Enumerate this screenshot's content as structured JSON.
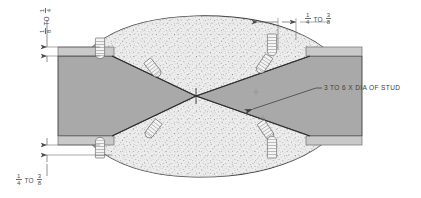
{
  "drawing": {
    "title": "Stud Weld Plate Joint Cross-Section",
    "colors": {
      "plate_fill": "#a8a8a8",
      "plate_fill_light": "#b4b4b4",
      "stipple_fill": "#e8e8e8",
      "stipple_dot": "#6e6e6e",
      "outline": "#3a3a3a",
      "dimension_line": "#555555",
      "text": "#4a4a4a",
      "background": "#ffffff",
      "stud_fill": "#f2f2f2",
      "stud_line": "#5a5a5a"
    },
    "dimensions": [
      {
        "id": "left-top",
        "orientation": "vertical",
        "from_numerator": "1",
        "from_denominator": "8",
        "separator": "TO",
        "to_numerator": "1",
        "to_denominator": "4"
      },
      {
        "id": "top-right",
        "orientation": "horizontal",
        "from_numerator": "1",
        "from_denominator": "4",
        "separator": "TO",
        "to_numerator": "3",
        "to_denominator": "8"
      },
      {
        "id": "bottom-left",
        "orientation": "vertical",
        "from_numerator": "1",
        "from_denominator": "4",
        "separator": "TO",
        "to_numerator": "3",
        "to_denominator": "8"
      }
    ],
    "annotations": [
      {
        "id": "stud-spacing",
        "text": "3 TO 6 X DIA OF STUD"
      }
    ],
    "studs": [
      {
        "id": "stud-top-left",
        "x": 100,
        "y": 48,
        "angle": 0
      },
      {
        "id": "stud-upper-mid",
        "x": 153,
        "y": 68,
        "angle": -38
      },
      {
        "id": "stud-upper-right",
        "x": 268,
        "y": 62,
        "angle": 34
      },
      {
        "id": "stud-top-right",
        "x": 272,
        "y": 40,
        "angle": 0
      },
      {
        "id": "stud-lower-left",
        "x": 153,
        "y": 133,
        "angle": 38
      },
      {
        "id": "stud-lower-mid",
        "x": 268,
        "y": 128,
        "angle": -34
      },
      {
        "id": "stud-bottom-right",
        "x": 272,
        "y": 152,
        "angle": 0
      }
    ]
  }
}
